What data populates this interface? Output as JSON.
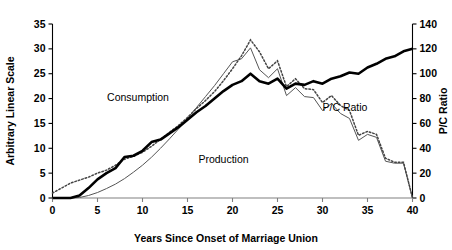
{
  "chart_data": {
    "type": "line",
    "title": "",
    "xlabel": "Years Since Onset of Marriage Union",
    "ylabel": "Arbitrary Linear Scale",
    "y2label": "P/C Ratio",
    "xlim": [
      0,
      40
    ],
    "ylim": [
      0,
      35
    ],
    "y2lim": [
      0,
      140
    ],
    "grid": false,
    "legend_position": "inline-annotations",
    "x_ticks": [
      0,
      5,
      10,
      15,
      20,
      25,
      30,
      35,
      40
    ],
    "y_ticks": [
      0,
      5,
      10,
      15,
      20,
      25,
      30,
      35
    ],
    "y2_ticks": [
      0,
      20,
      40,
      60,
      80,
      100,
      120,
      140
    ],
    "annotations": [
      {
        "text": "Consumption",
        "x": 9.5,
        "y": 19.5
      },
      {
        "text": "Production",
        "x": 19.0,
        "y": 7.0
      },
      {
        "text": "P/C Ratio",
        "x": 32.5,
        "y": 17.5
      }
    ],
    "series": [
      {
        "name": "Consumption",
        "axis": "left",
        "style": "dotted",
        "x": [
          0,
          1,
          2,
          3,
          4,
          5,
          6,
          7,
          8,
          9,
          10,
          11,
          12,
          13,
          14,
          15,
          16,
          17,
          18,
          19,
          20,
          21,
          22,
          23,
          24,
          25,
          26,
          27,
          28,
          29,
          30,
          31,
          32,
          33,
          34,
          35,
          36,
          37,
          38,
          39,
          40
        ],
        "values": [
          1.0,
          2.0,
          3.0,
          3.6,
          4.2,
          5.0,
          5.6,
          6.6,
          7.8,
          8.4,
          9.2,
          10.4,
          11.8,
          13.2,
          14.6,
          16.2,
          18.0,
          19.6,
          21.4,
          23.6,
          26.0,
          28.6,
          31.8,
          29.4,
          26.0,
          27.6,
          22.4,
          24.0,
          22.0,
          21.8,
          19.2,
          20.6,
          18.6,
          17.6,
          12.6,
          13.4,
          12.8,
          8.0,
          7.2,
          7.2,
          0.0
        ]
      },
      {
        "name": "Production",
        "axis": "left",
        "style": "thin-solid",
        "x": [
          0,
          1,
          2,
          3,
          4,
          5,
          6,
          7,
          8,
          9,
          10,
          11,
          12,
          13,
          14,
          15,
          16,
          17,
          18,
          19,
          20,
          21,
          22,
          23,
          24,
          25,
          26,
          27,
          28,
          29,
          30,
          31,
          32,
          33,
          34,
          35,
          36,
          37,
          38,
          39,
          40
        ],
        "values": [
          0.0,
          0.0,
          0.0,
          0.1,
          0.5,
          1.1,
          1.9,
          2.8,
          3.9,
          5.2,
          6.6,
          8.2,
          10.0,
          11.9,
          13.9,
          16.0,
          18.2,
          20.4,
          22.6,
          25.0,
          27.4,
          28.0,
          30.2,
          25.8,
          24.2,
          26.0,
          20.6,
          22.2,
          20.4,
          20.2,
          17.6,
          19.0,
          17.0,
          16.0,
          11.6,
          12.8,
          12.2,
          7.4,
          7.0,
          7.0,
          0.0
        ]
      },
      {
        "name": "P/C Ratio",
        "axis": "right",
        "style": "thick-solid",
        "x": [
          0,
          1,
          2,
          3,
          4,
          5,
          6,
          7,
          8,
          9,
          10,
          11,
          12,
          13,
          14,
          15,
          16,
          17,
          18,
          19,
          20,
          21,
          22,
          23,
          24,
          25,
          26,
          27,
          28,
          29,
          30,
          31,
          32,
          33,
          34,
          35,
          36,
          37,
          38,
          39,
          40
        ],
        "values": [
          0,
          0,
          0,
          2,
          8,
          15,
          20,
          24,
          33,
          34,
          38,
          45,
          47,
          52,
          57,
          63,
          69,
          74,
          80,
          86,
          91,
          94,
          100,
          94,
          92,
          96,
          88,
          92,
          91,
          94,
          92,
          96,
          98,
          101,
          100,
          105,
          108,
          112,
          114,
          118,
          120
        ]
      }
    ]
  }
}
